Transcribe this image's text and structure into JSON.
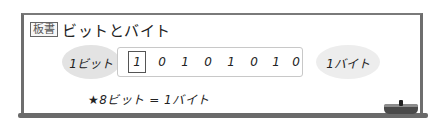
{
  "board": {
    "tag": "板書",
    "title": "ビットとバイト"
  },
  "diagram": {
    "bit_label": "1ビット",
    "byte_label": "1バイト",
    "digits": [
      "1",
      "0",
      "1",
      "0",
      "1",
      "0",
      "1",
      "0"
    ]
  },
  "note": "★8ビット = 1バイト",
  "colors": {
    "frame": "#6e6e6e",
    "bubble": "#e3e3e3",
    "digit_box_border": "#c8c8c8"
  }
}
